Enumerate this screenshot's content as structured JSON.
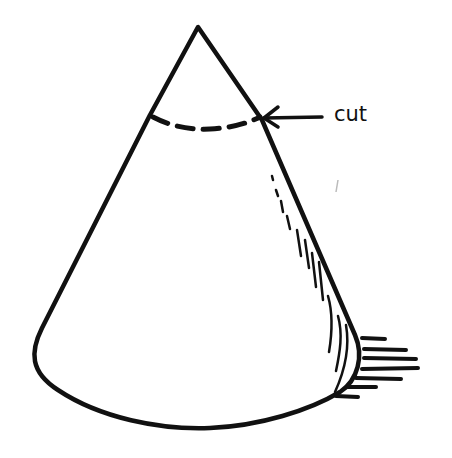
{
  "figure": {
    "annotation": {
      "label": "cut",
      "points_to": "dashed cut line near apex"
    },
    "colors": {
      "ink": "#111111",
      "background": "#ffffff"
    }
  }
}
